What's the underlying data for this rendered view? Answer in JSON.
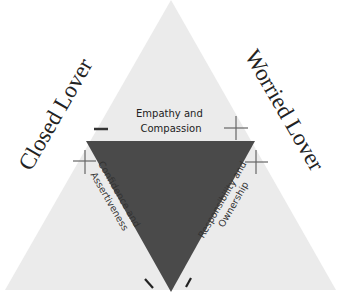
{
  "diagram": {
    "type": "nested-triangle",
    "colors": {
      "background": "#ffffff",
      "outer_triangle": "#ebebeb",
      "inner_triangle": "#4a4a4a",
      "marks": "#555555",
      "text": "#222222"
    },
    "side_labels": {
      "left": "Closed Lover",
      "right": "Worried Lover"
    },
    "region_labels": {
      "top": [
        "Empathy and",
        "Compassion"
      ],
      "left": [
        "Confidence and",
        "Assertiveness"
      ],
      "right": [
        "Responsibility and",
        "Ownership"
      ]
    },
    "marks": {
      "top_left": "minus",
      "top_right": "plus",
      "left_top": "plus",
      "right_top": "plus",
      "bottom_left": "minus",
      "bottom_right": "minus"
    }
  }
}
